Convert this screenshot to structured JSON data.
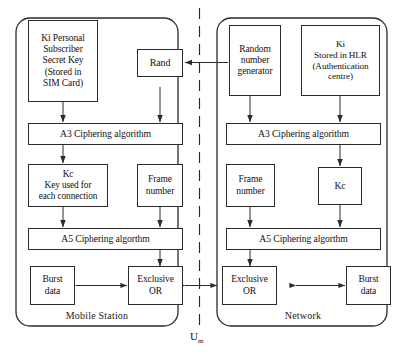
{
  "diagram": {
    "interface_label": "U",
    "interface_subscript": "m",
    "zones": [
      {
        "id": "mobile-station",
        "label": "Mobile Station"
      },
      {
        "id": "network",
        "label": "Network"
      }
    ],
    "nodes": {
      "ki_sim": {
        "lines": [
          "Ki Personal",
          "Subscriber",
          "Secret Key",
          "(Stored in",
          "SIM Card)"
        ]
      },
      "rand": {
        "lines": [
          "Rand"
        ]
      },
      "a3_ms": {
        "lines": [
          "A3 Ciphering algorithm"
        ]
      },
      "kc_ms": {
        "lines": [
          "Kc",
          "Key used for",
          "each connection"
        ]
      },
      "frame_ms": {
        "lines": [
          "Frame",
          "number"
        ]
      },
      "a5_ms": {
        "lines": [
          "A5 Ciphering algorthm"
        ]
      },
      "burst_ms": {
        "lines": [
          "Burst",
          "data"
        ]
      },
      "xor_ms": {
        "lines": [
          "Exclusive",
          "OR"
        ]
      },
      "rng_nw": {
        "lines": [
          "Random",
          "number",
          "generator"
        ]
      },
      "ki_hlr": {
        "lines": [
          "Ki",
          "Stored in HLR",
          "(Authentication",
          "centre)"
        ]
      },
      "a3_nw": {
        "lines": [
          "A3 Ciphering algorithm"
        ]
      },
      "frame_nw": {
        "lines": [
          "Frame",
          "number"
        ]
      },
      "kc_nw": {
        "lines": [
          "Kc"
        ]
      },
      "a5_nw": {
        "lines": [
          "A5 Ciphering algorthm"
        ]
      },
      "xor_nw": {
        "lines": [
          "Exclusive",
          "OR"
        ]
      },
      "burst_nw": {
        "lines": [
          "Burst",
          "data"
        ]
      }
    },
    "colors": {
      "stroke": "#2b2b2b",
      "background": "#ffffff",
      "text": "#111111"
    }
  }
}
